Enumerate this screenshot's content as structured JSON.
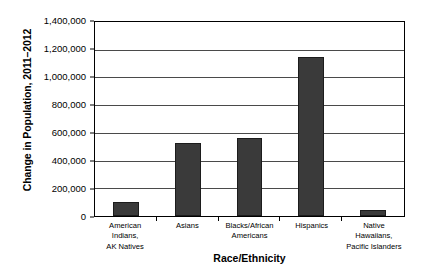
{
  "chart_data": {
    "type": "bar",
    "title": "",
    "xlabel": "Race/Ethnicity",
    "ylabel": "Change in Population, 2011–2012",
    "categories": [
      "American Indians, AK Natives",
      "Asians",
      "Blacks/African Americans",
      "Hispanics",
      "Native Hawaiians, Pacific Islanders"
    ],
    "category_lines": [
      [
        "American Indians,",
        "AK Natives"
      ],
      [
        "Asians"
      ],
      [
        "Blacks/African",
        "Americans"
      ],
      [
        "Hispanics"
      ],
      [
        "Native Hawaiians,",
        "Pacific Islanders"
      ]
    ],
    "values": [
      100000,
      530000,
      560000,
      1150000,
      40000
    ],
    "ylim": [
      0,
      1400000
    ],
    "ytick_values": [
      0,
      200000,
      400000,
      600000,
      800000,
      1000000,
      1200000,
      1400000
    ],
    "ytick_labels": [
      "0",
      "200,000",
      "400,000",
      "600,000",
      "800,000",
      "1,000,000",
      "1,200,000",
      "1,400,000"
    ],
    "grid": true,
    "legend": false,
    "bar_color": "#3a3a3a",
    "axis_color": "#000000",
    "gridline_color": "#4a4a4a",
    "background_color": "#ffffff"
  }
}
